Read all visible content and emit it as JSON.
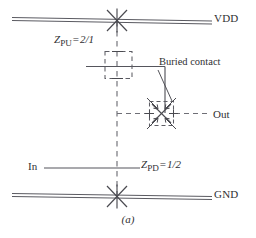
{
  "figure": {
    "caption": "(a)",
    "colors": {
      "ink": "#3a3a40",
      "rail": "#55555c",
      "dashed_diffusion": "#6f6f76",
      "text": "#2f2f33",
      "background": "#ffffff"
    }
  },
  "rails": {
    "vdd": {
      "label": "VDD",
      "style": "double-line",
      "y": 20
    },
    "gnd": {
      "label": "GND",
      "style": "double-line",
      "y": 196
    }
  },
  "ports": {
    "input": {
      "label": "In"
    },
    "output": {
      "label": "Out"
    }
  },
  "annotations": {
    "buried_contact": {
      "label": "Buried contact"
    },
    "pull_up": {
      "symbol": "Z",
      "subscript": "PU",
      "equals": "=",
      "value": "2/1",
      "full": "Z_PU = 2/1"
    },
    "pull_down": {
      "symbol": "Z",
      "subscript": "PD",
      "equals": "=",
      "value": "1/2",
      "full": "Z_PD = 1/2"
    }
  },
  "symbols": {
    "vdd_contact": "contact-cut-x",
    "gnd_contact": "contact-cut-x",
    "buried_contact_mark": "buried-contact-x-arrows",
    "pull_up_device": "depletion-implant-dashed-box"
  }
}
